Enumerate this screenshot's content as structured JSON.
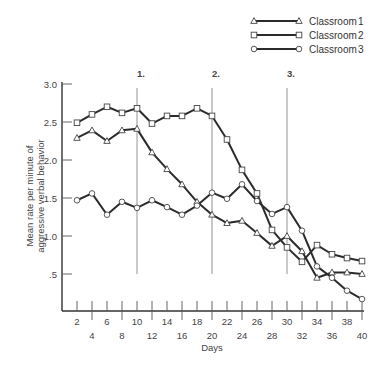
{
  "chart_data": {
    "type": "line",
    "title": "",
    "xlabel": "Days",
    "ylabel": "Mean rate per minute of aggressive verbal behavior",
    "ylabel_lines": [
      "Mean rate per minute of",
      "aggressive verbal behavior"
    ],
    "xlim": [
      0,
      40
    ],
    "ylim": [
      0,
      3.0
    ],
    "grid": false,
    "legend_position": "top-right",
    "y_ticks": [
      {
        "value": 3.0,
        "label": "3.0"
      },
      {
        "value": 2.5,
        "label": "2.5"
      },
      {
        "value": 2.0,
        "label": "2.0"
      },
      {
        "value": 1.5,
        "label": "1.5"
      },
      {
        "value": 1.0,
        "label": "1.0"
      },
      {
        "value": 0.5,
        "label": ".5"
      }
    ],
    "x_ticks_upper": [
      "2",
      "6",
      "10",
      "14",
      "18",
      "22",
      "26",
      "30",
      "34",
      "38"
    ],
    "x_ticks_lower": [
      "4",
      "8",
      "12",
      "16",
      "20",
      "24",
      "28",
      "32",
      "36",
      "40"
    ],
    "x": [
      2,
      4,
      6,
      8,
      10,
      12,
      14,
      16,
      18,
      20,
      22,
      24,
      26,
      28,
      30,
      32,
      34,
      36,
      38,
      40
    ],
    "phase_lines": [
      {
        "day": 10,
        "label": "1."
      },
      {
        "day": 20,
        "label": "2."
      },
      {
        "day": 30,
        "label": "3."
      }
    ],
    "series": [
      {
        "name": "Classroom",
        "number": "1",
        "marker": "triangle",
        "values": [
          2.29,
          2.39,
          2.25,
          2.39,
          2.41,
          2.1,
          1.88,
          1.68,
          1.45,
          1.28,
          1.17,
          1.2,
          1.04,
          0.87,
          1.0,
          0.8,
          0.45,
          0.52,
          0.52,
          0.5
        ]
      },
      {
        "name": "Classroom",
        "number": "2",
        "marker": "square",
        "values": [
          2.49,
          2.6,
          2.7,
          2.62,
          2.68,
          2.48,
          2.58,
          2.58,
          2.68,
          2.58,
          2.27,
          1.87,
          1.56,
          1.08,
          0.85,
          0.66,
          0.88,
          0.76,
          0.71,
          0.67
        ]
      },
      {
        "name": "Classroom",
        "number": "3",
        "marker": "circle",
        "values": [
          1.47,
          1.56,
          1.28,
          1.45,
          1.37,
          1.47,
          1.38,
          1.28,
          1.4,
          1.57,
          1.49,
          1.68,
          1.46,
          1.29,
          1.38,
          1.07,
          0.6,
          0.45,
          0.28,
          0.17
        ]
      }
    ]
  },
  "legend": {
    "items": [
      {
        "label": "Classroom",
        "number": "1",
        "marker": "triangle"
      },
      {
        "label": "Classroom",
        "number": "2",
        "marker": "square"
      },
      {
        "label": "Classroom",
        "number": "3",
        "marker": "circle"
      }
    ]
  }
}
